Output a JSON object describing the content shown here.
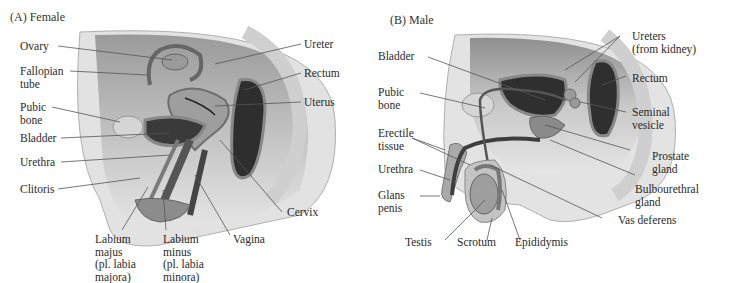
{
  "female": {
    "title": "(A) Female",
    "labels": {
      "ovary": "Ovary",
      "fallopian_tube": "Fallopian\ntube",
      "pubic_bone": "Pubic\nbone",
      "bladder": "Bladder",
      "urethra": "Urethra",
      "clitoris": "Clitoris",
      "labium_majus": "Labium\nmajus\n(pl. labia\nmajora)",
      "labium_minus": "Labium\nminus\n(pl. labia\nminora)",
      "vagina": "Vagina",
      "cervix": "Cervix",
      "uterus": "Uterus",
      "rectum": "Rectum",
      "ureter": "Ureter"
    }
  },
  "male": {
    "title": "(B) Male",
    "labels": {
      "bladder": "Bladder",
      "pubic_bone": "Pubic\nbone",
      "erectile_tissue": "Erectile\ntissue",
      "urethra": "Urethra",
      "glans_penis": "Glans\npenis",
      "testis": "Testis",
      "scrotum": "Scrotum",
      "epididymis": "Epididymis",
      "vas_deferens": "Vas deferens",
      "bulbourethral_gland": "Bulbourethral\ngland",
      "prostate_gland": "Prostate\ngland",
      "seminal_vesicle": "Seminal\nvesicle",
      "rectum": "Rectum",
      "ureters": "Ureters\n(from kidney)"
    }
  },
  "colors": {
    "body_light": "#e6e6e6",
    "body_mid": "#bdbdbd",
    "body_dark": "#6e6e6e",
    "cavity_dark": "#3a3a3a",
    "leader_line": "#555555"
  }
}
